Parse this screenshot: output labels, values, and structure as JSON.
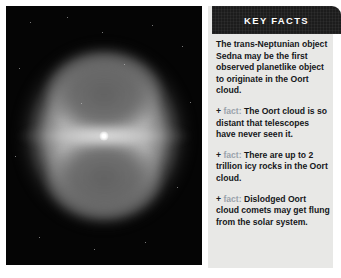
{
  "photo": {
    "alt_description": "Deep-space telescope image of a bipolar nebula with a bright central star",
    "background_color": "#000000"
  },
  "panel": {
    "header": {
      "title": "KEY FACTS",
      "background_color": "#1c1c1c",
      "text_color": "#ffffff"
    },
    "background_color": "#e8e8e6",
    "intro": "The trans-Neptunian object Sedna may be the first observed planetlike object to originate in the Oort cloud.",
    "fact_marker": "+",
    "fact_label": "fact:",
    "fact_label_color": "#9aa3ab",
    "facts": [
      {
        "text": "The Oort cloud is so distant that telescopes have never seen it."
      },
      {
        "text": "There are up to 2 trillion icy rocks in the Oort cloud."
      },
      {
        "text": "Dislodged Oort cloud comets may get flung from the solar system."
      }
    ]
  }
}
